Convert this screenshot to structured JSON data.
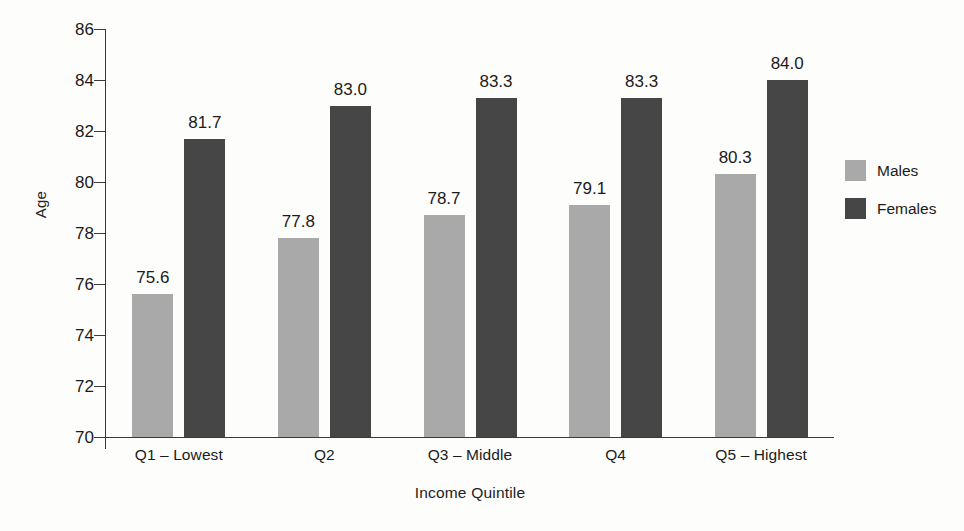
{
  "chart_data": {
    "type": "bar",
    "title": "",
    "xlabel": "Income Quintile",
    "ylabel": "Age",
    "categories": [
      "Q1 – Lowest",
      "Q2",
      "Q3 – Middle",
      "Q4",
      "Q5 – Highest"
    ],
    "series": [
      {
        "name": "Males",
        "color": "#a9a9a9",
        "values": [
          75.6,
          77.8,
          78.7,
          79.1,
          80.3
        ]
      },
      {
        "name": "Females",
        "color": "#464646",
        "values": [
          81.7,
          83.0,
          83.3,
          83.3,
          84.0
        ]
      }
    ],
    "value_labels": [
      [
        "75.6",
        "81.7"
      ],
      [
        "77.8",
        "83.0"
      ],
      [
        "78.7",
        "83.3"
      ],
      [
        "79.1",
        "83.3"
      ],
      [
        "80.3",
        "84.0"
      ]
    ],
    "ylim": [
      70,
      86
    ],
    "yticks": [
      86,
      84,
      82,
      80,
      78,
      76,
      74,
      72,
      70
    ],
    "ytick_labels": [
      "86",
      "84",
      "82",
      "80",
      "78",
      "76",
      "74",
      "72",
      "70"
    ],
    "grid": false,
    "legend_position": "right",
    "background_color": "#fdfdfc",
    "axis_color": "#3a3a3a"
  },
  "legend": {
    "entries": [
      {
        "label": "Males"
      },
      {
        "label": "Females"
      }
    ]
  }
}
